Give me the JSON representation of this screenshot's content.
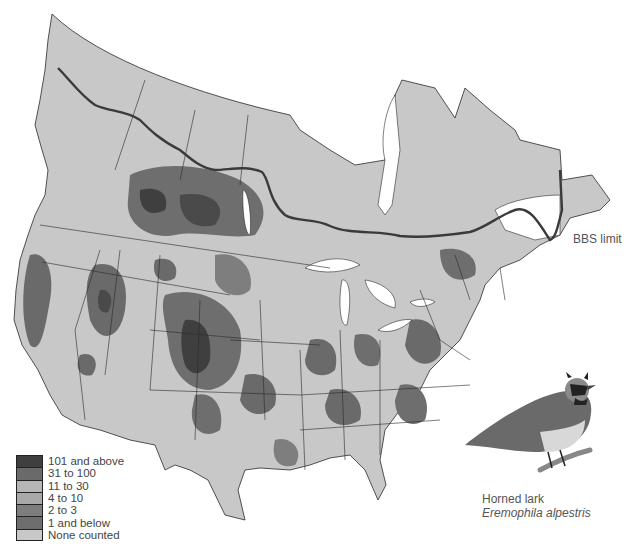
{
  "map": {
    "subject": "Horned lark relative abundance across North America (BBS survey area)",
    "colors": {
      "background": "#ffffff",
      "none_counted": "#c8c8c8",
      "water": "#ffffff",
      "boundary": "#2a2a2a",
      "bbs_limit_line": "#3a3a3a"
    },
    "bbs_limit_label": "BBS limit"
  },
  "legend": {
    "items": [
      {
        "label": "101 and above",
        "color": "#3f3f3f"
      },
      {
        "label": "31 to 100",
        "color": "#6a6a6a"
      },
      {
        "label": "11 to 30",
        "color": "#b6b6b6"
      },
      {
        "label": "4 to 10",
        "color": "#a9a9a9"
      },
      {
        "label": "2 to 3",
        "color": "#7e7e7e"
      },
      {
        "label": "1 and below",
        "color": "#6e6e6e"
      },
      {
        "label": "None counted",
        "color": "#c8c8c8"
      }
    ]
  },
  "caption": {
    "common_name": "Horned lark",
    "scientific_name": "Eremophila alpestris"
  }
}
